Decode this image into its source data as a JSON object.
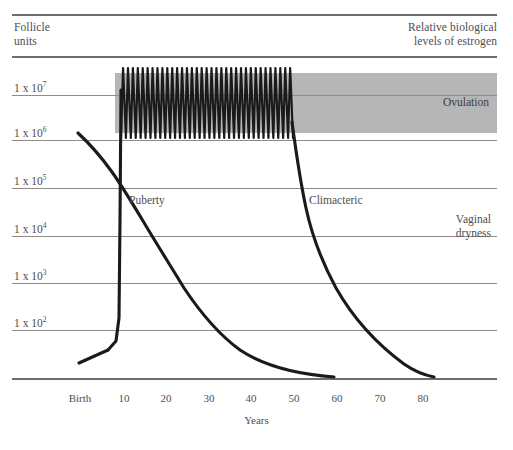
{
  "header": {
    "left_label": "Follicle\nunits",
    "left_line1": "Follicle",
    "left_line2": "units",
    "right_line1": "Relative biological",
    "right_line2": "levels of estrogen"
  },
  "annotations": {
    "puberty": "Puberty",
    "climacteric": "Climacteric",
    "ovulation": "Ovulation",
    "vaginal_dryness_line1": "Vaginal",
    "vaginal_dryness_line2": "dryness"
  },
  "colors": {
    "band": "#b6b6b6",
    "gridline": "#8c8c8c",
    "axis": "#6e6e6e",
    "curve": "#1a1a1a",
    "text": "#4e4e4e",
    "background": "#ffffff"
  },
  "chart_data": {
    "type": "line",
    "title": "",
    "subtitle": "",
    "xlabel": "Years",
    "ylabel": "Follicle units",
    "y2label": "Relative biological levels of estrogen",
    "grid": true,
    "legend": "none",
    "xlim": [
      0,
      90
    ],
    "ylim_log10": [
      1,
      7.6
    ],
    "xticks": [
      "Birth",
      "10",
      "20",
      "30",
      "40",
      "50",
      "60",
      "70",
      "80"
    ],
    "xtick_values": [
      0,
      10,
      20,
      30,
      40,
      50,
      60,
      70,
      80
    ],
    "yticks": [
      "1 x 10⁷",
      "1 x 10⁶",
      "1 x 10⁵",
      "1 x 10⁴",
      "1 x 10³",
      "1 x 10²"
    ],
    "ytick_mantissa": "1 x 10",
    "ytick_exponents": [
      "7",
      "6",
      "5",
      "4",
      "3",
      "2"
    ],
    "ytick_values": [
      10000000,
      1000000,
      100000,
      10000,
      1000,
      100
    ],
    "series": [
      {
        "name": "Follicle units",
        "description": "Log-scale decline of ovarian follicle reserve from birth to about age 52",
        "points": [
          [
            1.5,
            2000000
          ],
          [
            5,
            900000
          ],
          [
            10,
            330000
          ],
          [
            13,
            200000
          ],
          [
            17,
            100000
          ],
          [
            21,
            55000
          ],
          [
            25,
            30000
          ],
          [
            30,
            14000
          ],
          [
            35,
            6000
          ],
          [
            40,
            2500
          ],
          [
            45,
            900
          ],
          [
            50,
            300
          ],
          [
            52,
            120
          ]
        ]
      },
      {
        "name": "Estrogen level",
        "description": "Relative biological estrogen: low before puberty, sharp rise at puberty, cyclic ovulatory peaks through reproductive years, sharp fall at climacteric, low after menopause",
        "phases": [
          {
            "phase": "childhood",
            "x_start": 1,
            "x_end": 9,
            "level": "very low, slowly rising"
          },
          {
            "phase": "puberty rise",
            "x_start": 9,
            "x_end": 11.5,
            "level": "steep rise to reproductive level"
          },
          {
            "phase": "reproductive cycling",
            "x_start": 11.5,
            "x_end": 47,
            "level": "cyclic peaks, ~35 monthly oscillations shown"
          },
          {
            "phase": "climacteric fall",
            "x_start": 47,
            "x_end": 52,
            "level": "steep decline"
          },
          {
            "phase": "postmenopause",
            "x_start": 52,
            "x_end": 85,
            "level": "low, gradual decline to minimum"
          }
        ],
        "cycle_count": 35
      }
    ],
    "bands": [
      {
        "name": "Ovulation",
        "orientation": "horizontal",
        "x_start": 10,
        "x_end": 90,
        "label": "Ovulation",
        "color": "#b6b6b6"
      }
    ],
    "annotations": [
      {
        "text": "Puberty",
        "x": 13,
        "note": "onset of cyclic estrogen"
      },
      {
        "text": "Climacteric",
        "x": 49,
        "note": "perimenopausal estrogen decline"
      },
      {
        "text": "Vaginal dryness",
        "x": 78,
        "note": "postmenopausal estrogen deficiency symptom"
      }
    ]
  }
}
